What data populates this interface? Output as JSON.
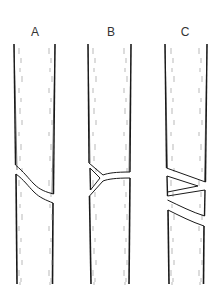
{
  "figure": {
    "panels": [
      {
        "label": "A",
        "crack_type": "single oblique crack",
        "label_x": 25
      },
      {
        "label": "B",
        "crack_type": "Y-shaped branching crack",
        "label_x": 101
      },
      {
        "label": "C",
        "crack_type": "zigzag multiple oblique cracks",
        "label_x": 175
      }
    ],
    "colors": {
      "line": "#1a1a1a",
      "hatch": "#8a8a8a",
      "background": "#ffffff"
    }
  }
}
